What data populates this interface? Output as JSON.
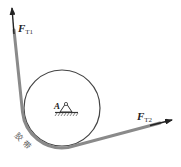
{
  "diagram": {
    "title": "",
    "labels": {
      "force1_main": "F",
      "force1_sub": "T1",
      "force2_main": "F",
      "force2_sub": "T2",
      "pin_label": "A",
      "belt_label": "胶带"
    },
    "colors": {
      "belt": "#8a8a8a",
      "circle": "#444444",
      "arrow": "#222222",
      "text": "#222222"
    },
    "elements": [
      {
        "type": "pulley",
        "shape": "circle",
        "center": [
          62,
          108
        ],
        "radius": 38
      },
      {
        "type": "belt",
        "description": "belt wrapping around lower-left of pulley"
      },
      {
        "type": "force-arrow",
        "name": "F_T1",
        "direction": "up, slightly left"
      },
      {
        "type": "force-arrow",
        "name": "F_T2",
        "direction": "right, slightly up"
      },
      {
        "type": "pin-support",
        "name": "A",
        "position": [
          66,
          108
        ]
      }
    ]
  }
}
